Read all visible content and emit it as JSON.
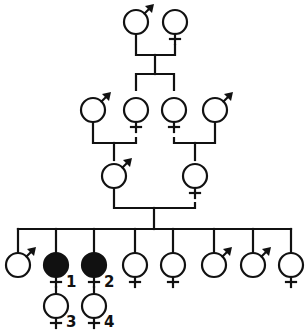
{
  "diagram": {
    "type": "pedigree",
    "colors": {
      "line": "#111111",
      "affected": "#111111",
      "background": "#ffffff"
    },
    "generations": [
      {
        "level": 1,
        "individuals": [
          {
            "id": "g1-m",
            "sex": "male",
            "affected": false
          },
          {
            "id": "g1-f",
            "sex": "female",
            "affected": false
          }
        ]
      },
      {
        "level": 2,
        "individuals": [
          {
            "id": "g2-m1",
            "sex": "male",
            "affected": false,
            "note": "spouse (married-in)"
          },
          {
            "id": "g2-f1",
            "sex": "female",
            "affected": false,
            "note": "child of g1"
          },
          {
            "id": "g2-f2",
            "sex": "female",
            "affected": false,
            "note": "child of g1"
          },
          {
            "id": "g2-m2",
            "sex": "male",
            "affected": false,
            "note": "spouse (married-in)"
          }
        ]
      },
      {
        "level": 3,
        "individuals": [
          {
            "id": "g3-m",
            "sex": "male",
            "affected": false
          },
          {
            "id": "g3-f",
            "sex": "female",
            "affected": false
          }
        ]
      },
      {
        "level": 4,
        "individuals": [
          {
            "id": "g4-1",
            "sex": "male",
            "affected": false
          },
          {
            "id": "g4-2",
            "sex": "female",
            "affected": true,
            "label": "1"
          },
          {
            "id": "g4-3",
            "sex": "female",
            "affected": true,
            "label": "2"
          },
          {
            "id": "g4-4",
            "sex": "female",
            "affected": false
          },
          {
            "id": "g4-5",
            "sex": "female",
            "affected": false
          },
          {
            "id": "g4-6",
            "sex": "male",
            "affected": false
          },
          {
            "id": "g4-7",
            "sex": "male",
            "affected": false
          },
          {
            "id": "g4-8",
            "sex": "female",
            "affected": false
          }
        ]
      },
      {
        "level": 5,
        "individuals": [
          {
            "id": "g5-1",
            "sex": "female",
            "affected": false,
            "label": "3",
            "parent": "g4-2"
          },
          {
            "id": "g5-2",
            "sex": "female",
            "affected": false,
            "label": "4",
            "parent": "g4-3"
          }
        ]
      }
    ],
    "labels": {
      "l1": "1",
      "l2": "2",
      "l3": "3",
      "l4": "4"
    }
  }
}
